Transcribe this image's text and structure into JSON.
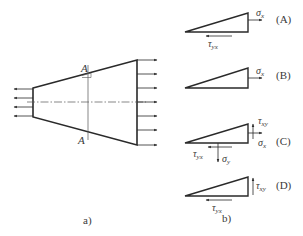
{
  "figure": {
    "part_a": {
      "caption": "a)",
      "section_label_top": "A",
      "section_label_bottom": "A",
      "shape": "trapezoid",
      "left_arrows_count": 4,
      "right_arrows_count": 7
    },
    "part_b": {
      "caption": "b)",
      "options": [
        {
          "label": "(A)",
          "stresses": [
            {
              "sym": "σ",
              "sub": "x"
            },
            {
              "sym": "τ",
              "sub": "yx"
            }
          ]
        },
        {
          "label": "(B)",
          "stresses": [
            {
              "sym": "σ",
              "sub": "x"
            }
          ]
        },
        {
          "label": "(C)",
          "stresses": [
            {
              "sym": "τ",
              "sub": "xy"
            },
            {
              "sym": "σ",
              "sub": "x"
            },
            {
              "sym": "τ",
              "sub": "yx"
            },
            {
              "sym": "σ",
              "sub": "y"
            }
          ]
        },
        {
          "label": "(D)",
          "stresses": [
            {
              "sym": "τ",
              "sub": "xy"
            },
            {
              "sym": "τ",
              "sub": "yx"
            }
          ]
        }
      ]
    },
    "colors": {
      "line": "#2a2a2a",
      "thin": "#555555",
      "text": "#3a3a3a"
    }
  }
}
